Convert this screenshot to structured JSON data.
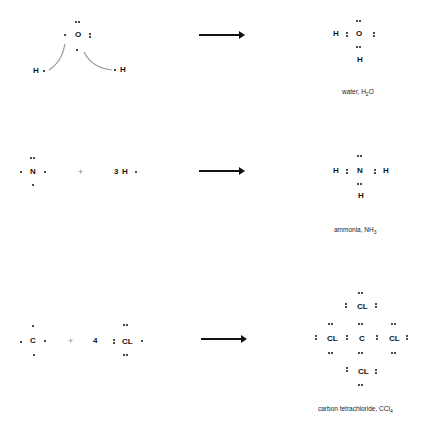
{
  "reactions": [
    {
      "reactants": {
        "atom1": "O",
        "h_left": "H",
        "h_right": "H"
      },
      "product": {
        "center": "O",
        "left": "H",
        "bottom": "H"
      },
      "caption": {
        "name": "water, H",
        "sub": "2",
        "tail": "O"
      }
    },
    {
      "reactants": {
        "atom1": "N",
        "coef": "3",
        "atom2": "H",
        "plus": "+"
      },
      "product": {
        "center": "N",
        "left": "H",
        "right": "H",
        "bottom": "H"
      },
      "caption": {
        "name": "ammonia, NH",
        "sub": "3",
        "tail": ""
      }
    },
    {
      "reactants": {
        "atom1": "C",
        "coef": "4",
        "atom2": "CL",
        "plus": "+"
      },
      "product": {
        "center": "C",
        "top": "CL",
        "left": "CL",
        "right": "CL",
        "bottom": "CL"
      },
      "caption": {
        "name": "carbon tetrachloride, CCl",
        "sub": "4",
        "tail": ""
      }
    }
  ]
}
